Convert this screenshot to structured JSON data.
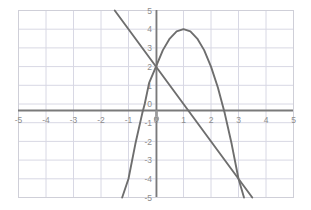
{
  "chart_data": {
    "type": "line",
    "title": "",
    "xlabel": "",
    "ylabel": "",
    "xlim": [
      -5,
      5
    ],
    "ylim": [
      -5,
      5
    ],
    "grid": true,
    "legend_position": "none",
    "x_ticks": [
      "-5",
      "-4",
      "-3",
      "-2",
      "-1",
      "0",
      "1",
      "2",
      "3",
      "4",
      "5"
    ],
    "x_tick_values": [
      -5,
      -4,
      -3,
      -2,
      -1,
      0,
      1,
      2,
      3,
      4,
      5
    ],
    "y_ticks": [
      "5",
      "4",
      "3",
      "2",
      "1",
      "0",
      "-1",
      "-2",
      "-3",
      "-4",
      "-5"
    ],
    "y_tick_values": [
      5,
      4,
      3,
      2,
      1,
      0,
      -1,
      -2,
      -3,
      -4,
      -5
    ],
    "series": [
      {
        "name": "parabola",
        "equation": "y = -2(x - 1)^2 + 4",
        "type": "quadratic",
        "vertex": [
          1,
          4
        ],
        "y_intercept": 2,
        "x_intercepts": [
          -0.41,
          2.41
        ],
        "color": "#6e6e6e",
        "x": [
          -1.23,
          -1.0,
          -0.75,
          -0.5,
          -0.41,
          -0.25,
          0,
          0.25,
          0.5,
          0.75,
          1,
          1.25,
          1.5,
          1.75,
          2,
          2.25,
          2.41,
          2.5,
          2.75,
          3,
          3.2
        ],
        "values": [
          -5.0,
          -4.0,
          -2.13,
          -0.5,
          0,
          1.13,
          2.0,
          2.88,
          3.5,
          3.88,
          4.0,
          3.88,
          3.5,
          2.88,
          2.0,
          0.88,
          0,
          -0.5,
          -2.13,
          -4.0,
          -5.0
        ]
      },
      {
        "name": "line",
        "equation": "y = -2x + 2",
        "type": "linear",
        "slope": -2,
        "y_intercept": 2,
        "x_intercept": 1,
        "color": "#6e6e6e",
        "x": [
          -1.5,
          3.5
        ],
        "values": [
          5,
          -5
        ]
      }
    ],
    "intersections": [
      [
        0,
        2
      ],
      [
        3,
        -4
      ]
    ],
    "colors": {
      "axis": "#7a7a7a",
      "grid": "#d8d8e4",
      "border": "#cfcfd8",
      "curve": "#6e6e6e",
      "tick_text": "#8d8d8d",
      "background": "#ffffff"
    }
  },
  "axes": {
    "x_axis_label": "x",
    "y_axis_label": "y",
    "origin_label": "0"
  }
}
